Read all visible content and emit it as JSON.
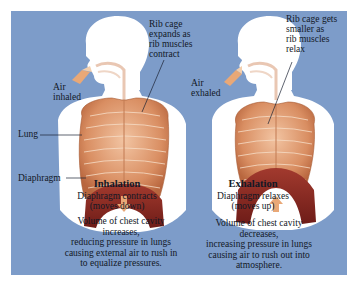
{
  "colors": {
    "background_panel": "#7d9cc9",
    "body_silhouette": "#ffffff",
    "ribcage": "#e3a27a",
    "diaphragm": "#8e2a24",
    "airflow": "#e9a877",
    "text": "#121826"
  },
  "inhalation": {
    "title": "Inhalation",
    "rib_label": [
      "Rib cage",
      "expands as",
      "rib muscles",
      "contract"
    ],
    "air_label": [
      "Air",
      "inhaled"
    ],
    "lung_label": "Lung",
    "diaphragm_label": "Diaphragm",
    "diaphragm_state": [
      "Diaphragm contracts",
      "(moves down)"
    ],
    "description": [
      "Volume of chest cavity",
      "increases,",
      "reducing pressure in lungs",
      "causing external air to rush in",
      "to equalize pressures."
    ],
    "arrow_direction": "down"
  },
  "exhalation": {
    "title": "Exhalation",
    "rib_label": [
      "Rib cage gets",
      "smaller as",
      "rib muscles",
      "relax"
    ],
    "air_label": [
      "Air",
      "exhaled"
    ],
    "diaphragm_state": [
      "Diaphragm relaxes",
      "(moves up)"
    ],
    "description": [
      "Volume of chest cavity",
      "decreases,",
      "increasing pressure in lungs",
      "causing air to rush out into",
      "atmosphere."
    ],
    "arrow_direction": "up"
  }
}
